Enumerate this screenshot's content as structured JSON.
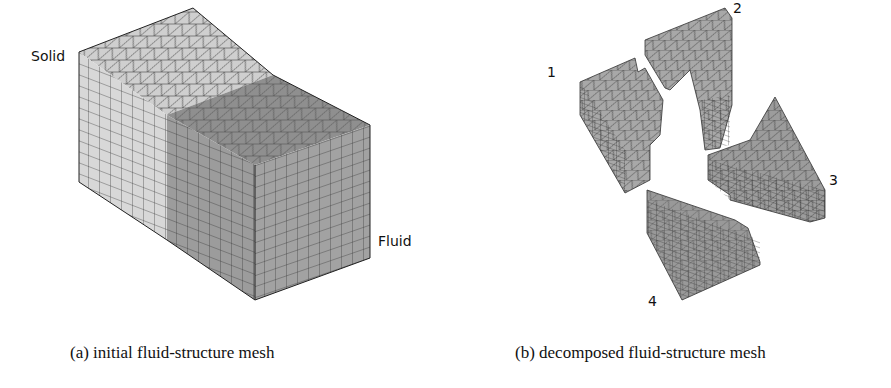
{
  "figure": {
    "panels": [
      {
        "id": "a",
        "caption": "(a) initial fluid-structure mesh",
        "labels": {
          "solid": "Solid",
          "fluid": "Fluid"
        }
      },
      {
        "id": "b",
        "caption": "(b) decomposed fluid-structure mesh",
        "partitions": [
          "1",
          "2",
          "3",
          "4"
        ]
      }
    ],
    "colors": {
      "solid_face": "#d6d6d6",
      "solid_top": "#cfcfcf",
      "fluid_face": "#9a9a9a",
      "fluid_top": "#8e8e8e",
      "partition_face": "#a3a3a3",
      "mesh_line": "#333333"
    }
  }
}
